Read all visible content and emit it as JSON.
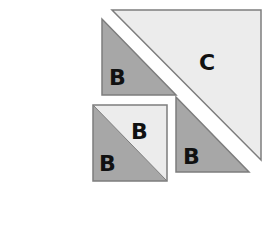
{
  "colors": {
    "dark_fill": "#a7a7a7",
    "light_fill": "#ececec",
    "stroke": "#7d7d7d",
    "text": "#111111",
    "background": "#ffffff"
  },
  "shapes": {
    "triangle_c": {
      "label": "C",
      "points": "112,10 261,10 261,160"
    },
    "triangle_b_top_left": {
      "label": "B",
      "points": "102,19 102,95 176,95"
    },
    "triangle_b_right": {
      "label": "B",
      "points": "176,97 176,172 249,172"
    },
    "square": {
      "x": 93,
      "y": 105,
      "width": 74,
      "height": 76,
      "upper_triangle": {
        "label": "B",
        "points": "93,105 167,105 167,181"
      },
      "lower_triangle": {
        "label": "B",
        "points": "93,105 93,181 167,181"
      }
    }
  },
  "labels": {
    "c": "C",
    "b_top_left": "B",
    "b_square_upper": "B",
    "b_square_lower": "B",
    "b_right": "B"
  }
}
